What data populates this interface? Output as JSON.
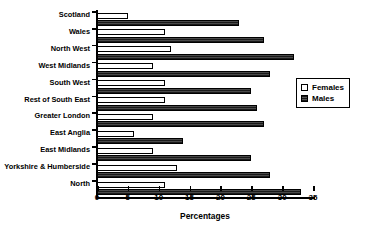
{
  "chart_data": {
    "type": "bar",
    "orientation": "horizontal",
    "title": "",
    "xlabel": "Percentages",
    "ylabel": "",
    "xlim": [
      0,
      35
    ],
    "xticks": [
      0,
      5,
      10,
      15,
      20,
      25,
      30,
      35
    ],
    "grid": false,
    "legend_position": "right",
    "categories": [
      "Scotland",
      "Wales",
      "North West",
      "West Midlands",
      "South West",
      "Rest of South East",
      "Greater London",
      "East Anglia",
      "East Midlands",
      "Yorkshire & Humberside",
      "North"
    ],
    "series": [
      {
        "name": "Females",
        "style": "hollow",
        "color": "#ffffff",
        "values": [
          5,
          11,
          12,
          9,
          11,
          11,
          9,
          6,
          9,
          13,
          11
        ]
      },
      {
        "name": "Males",
        "style": "filled",
        "color": "#2b2b2b",
        "values": [
          23,
          27,
          32,
          28,
          25,
          26,
          27,
          14,
          25,
          28,
          33
        ]
      }
    ]
  },
  "legend": {
    "items": [
      {
        "label": "Females"
      },
      {
        "label": "Males"
      }
    ]
  }
}
